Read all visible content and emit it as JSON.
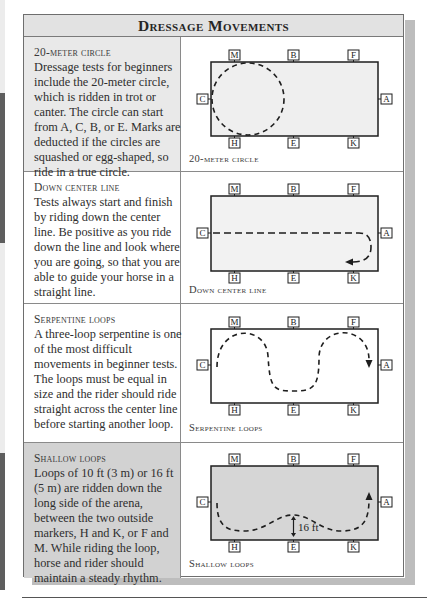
{
  "header": {
    "title": "Dressage Movements"
  },
  "markers": {
    "top": [
      "M",
      "B",
      "F"
    ],
    "bottom": [
      "H",
      "E",
      "K"
    ],
    "left": "C",
    "right": "A"
  },
  "rows": [
    {
      "title": "20-meter circle",
      "body": "Dressage tests for beginners include the 20-meter circle, which is ridden in trot or canter. The circle can start from A, C, B, or E. Marks are deducted if the circles are squashed or egg-shaped, so ride in a true circle.",
      "caption": "20-meter circle",
      "diagram": "circle"
    },
    {
      "title": "Down center line",
      "body": "Tests always start and finish by riding down the center line. Be positive as you ride down the line and look where you are going, so that you are able to guide your horse in a straight line.",
      "caption": "Down center line",
      "diagram": "center-line"
    },
    {
      "title": "Serpentine loops",
      "body": "A three-loop serpentine is one of the most difficult movements in beginner tests. The loops must be equal in size and the rider should ride straight across the center line before starting another loop.",
      "caption": "Serpentine loops",
      "diagram": "serpentine"
    },
    {
      "title": "Shallow loops",
      "body": "Loops of 10 ft (3 m) or 16 ft (5 m) are ridden down the long side of the arena, between the two outside markers, H and K, or F and M. While riding the loop, horse and rider should maintain a steady rhythm.",
      "caption": "Shallow loops",
      "diagram": "shallow-loops",
      "measure_label": "16 ft"
    }
  ],
  "colors": {
    "frame": "#6e6e6e",
    "header_bg": "#e2e2e2",
    "row1_text_bg": "#e9e9e9",
    "row4_text_bg": "#d2d2d2",
    "shadow": "#bdbdbd",
    "arena_fill": "#efefef",
    "arena_fill_dark": "#d6d6d6"
  }
}
